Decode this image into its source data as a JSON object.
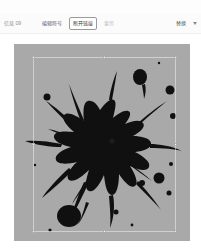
{
  "window": {
    "title": ""
  },
  "toolbar": {
    "status_label": "信息 09",
    "buttons": [
      {
        "name": "edit-symbol",
        "label": "编辑符号",
        "state": "normal"
      },
      {
        "name": "break-link",
        "label": "断开链接",
        "state": "active"
      },
      {
        "name": "replace-disabled",
        "label": "重置",
        "state": "disabled"
      },
      {
        "name": "replace",
        "label": "替换",
        "state": "normal"
      }
    ],
    "overflow_icon": "chevron-down-icon"
  },
  "canvas": {
    "background_color": "#a9a9a9",
    "selection": {
      "active": true,
      "handle_color": "#ffffff",
      "handle_count": 8
    },
    "artwork": {
      "name": "ink-splatter",
      "ink_color": "#101010",
      "description": "black ink splatter with radiating spikes and scattered droplets"
    }
  },
  "colors": {
    "toolbar_bg": "#fbfbfc",
    "page_bg": "#ffffff",
    "canvas_gray": "#a9a9a9",
    "ink_black": "#101010",
    "text_muted": "#8a8a90"
  }
}
